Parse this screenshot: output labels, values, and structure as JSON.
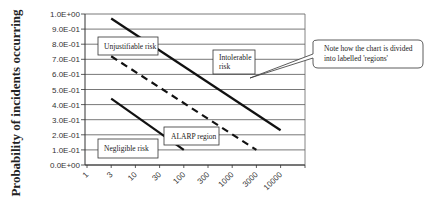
{
  "chart_data": {
    "type": "line",
    "title": "",
    "xlabel": "",
    "ylabel": "Probability of incidents occurring",
    "x_scale": "log",
    "x_tick_labels": [
      "1",
      "3",
      "10",
      "30",
      "100",
      "300",
      "1000",
      "3000",
      "10000"
    ],
    "y_tick_labels": [
      "0.0E+00",
      "1.0E-01",
      "2.0E-01",
      "3.0E-01",
      "4.0E-01",
      "5.0E-01",
      "6.0E-01",
      "7.0E-01",
      "8.0E-01",
      "9.0E-01",
      "1.0E+00"
    ],
    "ylim": [
      0,
      1.0
    ],
    "grid": true,
    "legend": "none",
    "series": [
      {
        "name": "Intolerable boundary",
        "style": "solid",
        "x": [
          3,
          10000
        ],
        "y": [
          0.97,
          0.23
        ]
      },
      {
        "name": "ALARP upper boundary",
        "style": "dashed",
        "x": [
          3,
          3000
        ],
        "y": [
          0.72,
          0.1
        ]
      },
      {
        "name": "Negligible boundary",
        "style": "solid",
        "x": [
          3,
          100
        ],
        "y": [
          0.44,
          0.1
        ]
      }
    ],
    "annotations": [
      {
        "text": "Unjustifiable risk",
        "region": "upper-left"
      },
      {
        "text": "Intolerable risk",
        "region": "upper-right"
      },
      {
        "text": "ALARP region",
        "region": "middle"
      },
      {
        "text": "Negligible risk",
        "region": "lower-left"
      },
      {
        "text": "Note how the chart is divided into labelled 'regions'",
        "type": "callout"
      }
    ]
  },
  "labels": {
    "ylabel": "Probability of incidents occurring",
    "unjustifiable": "Unjustifiable risk",
    "intolerable_1": "Intolerable",
    "intolerable_2": "risk",
    "alarp": "ALARP region",
    "negligible": "Negligible risk",
    "callout_1": "Note how the chart is divided",
    "callout_2": "into labelled 'regions'"
  },
  "colors": {
    "line": "#111111",
    "grid": "#555555",
    "axis_text": "#333333"
  }
}
